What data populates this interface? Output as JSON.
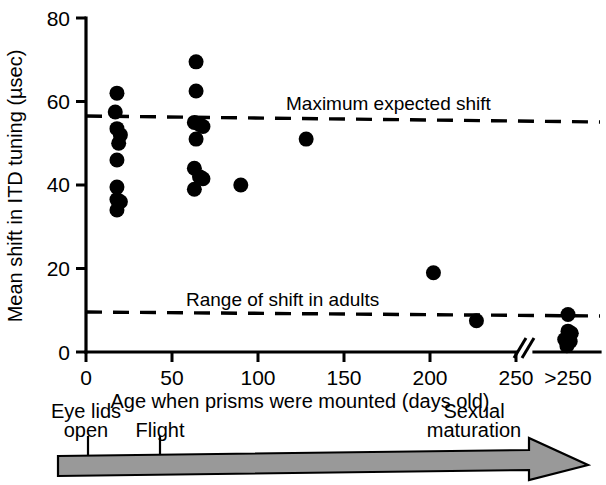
{
  "chart_data": {
    "type": "scatter",
    "title": "",
    "xlabel": "Age when prisms were mounted (days old)",
    "ylabel": "Mean shift in ITD tuning (µsec)",
    "xlim": [
      0,
      250
    ],
    "ylim": [
      0,
      80
    ],
    "xticks": [
      0,
      50,
      100,
      150,
      200,
      250
    ],
    "xticklabels": [
      "0",
      "50",
      "100",
      "150",
      "200",
      "250"
    ],
    "yticks": [
      0,
      20,
      40,
      60,
      80
    ],
    "yticklabels": [
      "0",
      "20",
      "40",
      "60",
      "80"
    ],
    "axis_break": {
      "symbol": "//",
      "after": 250
    },
    "extra_category": {
      "label": ">250",
      "description": "off-scale adult group plotted beyond the axis break"
    },
    "grid": false,
    "legend": "none",
    "points": [
      {
        "x": 18,
        "y": 62
      },
      {
        "x": 17,
        "y": 57.5
      },
      {
        "x": 18,
        "y": 53.5
      },
      {
        "x": 20,
        "y": 52
      },
      {
        "x": 19,
        "y": 50
      },
      {
        "x": 18,
        "y": 46
      },
      {
        "x": 18,
        "y": 39.5
      },
      {
        "x": 18,
        "y": 36.5
      },
      {
        "x": 20,
        "y": 36
      },
      {
        "x": 18,
        "y": 34
      },
      {
        "x": 64,
        "y": 69.5
      },
      {
        "x": 64,
        "y": 62.5
      },
      {
        "x": 63,
        "y": 55
      },
      {
        "x": 66,
        "y": 54.5
      },
      {
        "x": 68,
        "y": 54
      },
      {
        "x": 64,
        "y": 51
      },
      {
        "x": 63,
        "y": 44
      },
      {
        "x": 66,
        "y": 42
      },
      {
        "x": 68,
        "y": 41.5
      },
      {
        "x": 63,
        "y": 39
      },
      {
        "x": 90,
        "y": 40
      },
      {
        "x": 128,
        "y": 51
      },
      {
        "x": 202,
        "y": 19
      },
      {
        "x": 227,
        "y": 7.5
      },
      {
        "x": 262,
        "y": 9
      },
      {
        "x": 262,
        "y": 5
      },
      {
        "x": 259,
        "y": 3
      },
      {
        "x": 264,
        "y": 2.5
      },
      {
        "x": 261,
        "y": 1.5
      },
      {
        "x": 265,
        "y": 4.5
      }
    ],
    "reference_lines": [
      {
        "label": "Maximum expected shift",
        "y_start": 56.5,
        "y_end": 55,
        "style": "dashed"
      },
      {
        "label": "Range of shift in adults",
        "y_start": 9.5,
        "y_end": 8.5,
        "style": "dashed"
      }
    ]
  },
  "timeline": {
    "events": [
      {
        "label_line1": "Eye lids",
        "label_line2": "open"
      },
      {
        "label_line1": "Flight",
        "label_line2": ""
      },
      {
        "label_line1": "Sexual",
        "label_line2": "maturation"
      }
    ],
    "arrow_color": "#999999"
  },
  "colors": {
    "point": "#000000",
    "axis": "#000000",
    "background": "#ffffff",
    "arrow_fill": "#999999",
    "arrow_stroke": "#000000"
  }
}
